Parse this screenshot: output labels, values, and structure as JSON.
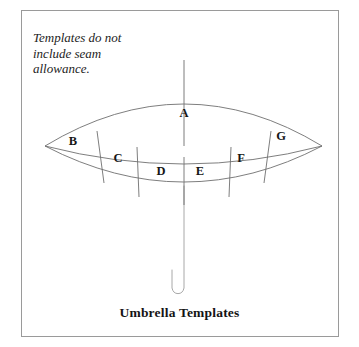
{
  "figure": {
    "note": "Templates do not\ninclude seam\nallowance.",
    "caption": "Umbrella Templates",
    "border_color": "#9a9a9a",
    "line_color": "#6b6b6b",
    "background": "#ffffff",
    "text_color": "#161616"
  },
  "panels": [
    {
      "id": "A",
      "label": "A",
      "x": 184,
      "y": 113,
      "role": "top-canopy-section"
    },
    {
      "id": "B",
      "label": "B",
      "x": 73,
      "y": 141,
      "role": "lower-band-section"
    },
    {
      "id": "C",
      "label": "C",
      "x": 118,
      "y": 158,
      "role": "lower-band-section"
    },
    {
      "id": "D",
      "label": "D",
      "x": 161,
      "y": 171,
      "role": "lower-band-section"
    },
    {
      "id": "E",
      "label": "E",
      "x": 200,
      "y": 171,
      "role": "lower-band-section"
    },
    {
      "id": "F",
      "label": "F",
      "x": 241,
      "y": 158,
      "role": "lower-band-section"
    },
    {
      "id": "G",
      "label": "G",
      "x": 281,
      "y": 136,
      "role": "lower-band-section"
    }
  ],
  "geometry": {
    "canopy": {
      "left_tip_x": 45,
      "left_tip_y": 146,
      "right_tip_x": 322,
      "right_tip_y": 146,
      "apex_x": 184,
      "apex_y": 88
    },
    "pole": {
      "top_x": 184,
      "top_y": 60,
      "bottom_y": 288,
      "hook_left_x": 172,
      "hook_bottom_y": 295
    }
  }
}
